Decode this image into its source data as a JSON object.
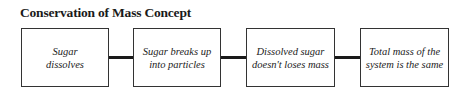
{
  "title": "Conservation of Mass Concept",
  "steps": [
    {
      "label": "Sugar\ndissolves"
    },
    {
      "label": "Sugar breaks up\ninto particles"
    },
    {
      "label": "Dissolved sugar\ndoesn't loses mass"
    },
    {
      "label": "Total mass of the\nsystem is the same"
    }
  ]
}
